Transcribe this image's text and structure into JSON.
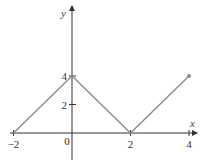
{
  "chart_data": {
    "type": "line",
    "title": "",
    "xlabel": "x",
    "ylabel": "y",
    "x": [
      -2,
      0,
      2,
      4
    ],
    "series": [
      {
        "name": "f(x)",
        "values": [
          0,
          4,
          0,
          4
        ],
        "color": "#8a8a8a"
      }
    ],
    "xticks": [
      -2,
      0,
      2,
      4
    ],
    "xtick_labels": [
      "−2",
      "0",
      "2",
      "4"
    ],
    "yticks": [
      2,
      4
    ],
    "ytick_labels": [
      "2",
      "4"
    ],
    "xlim": [
      -2.1,
      4.3
    ],
    "ylim": [
      -1.0,
      4.0
    ],
    "grid": false,
    "legend": null,
    "endpoint_marker": {
      "x": 4,
      "y": 4
    }
  },
  "colors": {
    "axis": "#333333",
    "line": "#8a8a8a",
    "text": "#333333"
  }
}
